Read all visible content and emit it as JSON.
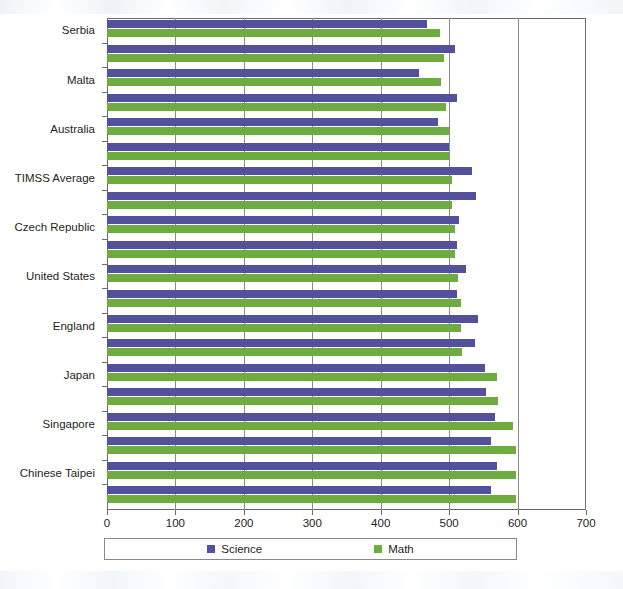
{
  "chart_data": {
    "type": "bar",
    "orientation": "horizontal",
    "title": "",
    "subtitle": "",
    "xlabel": "",
    "ylabel": "",
    "xlim": [
      0,
      700
    ],
    "xticks": [
      0,
      100,
      200,
      300,
      400,
      500,
      600,
      700
    ],
    "xtick_labels": [
      "0",
      "100",
      "200",
      "300",
      "400",
      "500",
      "600",
      "700"
    ],
    "grid": "vertical",
    "legend_position": "bottom",
    "series": [
      {
        "name": "Science",
        "color": "#53519b",
        "values": [
          468,
          508,
          456,
          511,
          484,
          500,
          534,
          539,
          515,
          512,
          524,
          512,
          542,
          538,
          552,
          554,
          567,
          561,
          570,
          561
        ]
      },
      {
        "name": "Math",
        "color": "#6fac3f",
        "values": [
          486,
          492,
          488,
          496,
          500,
          500,
          504,
          504,
          508,
          508,
          513,
          517,
          518,
          519,
          570,
          572,
          593,
          597,
          598,
          598
        ]
      }
    ],
    "categories": [
      "Serbia",
      "",
      "Malta",
      "",
      "Australia",
      "",
      "TIMSS Average",
      "",
      "Czech Republic",
      "",
      "United States",
      "",
      "England",
      "",
      "Japan",
      "",
      "Singapore",
      "",
      "Chinese Taipei",
      ""
    ],
    "visible_category_labels": [
      "Serbia",
      "Malta",
      "Australia",
      "TIMSS Average",
      "Czech Republic",
      "United States",
      "England",
      "Japan",
      "Singapore",
      "Chinese Taipei"
    ],
    "category_label_row_indices": [
      0,
      2,
      4,
      6,
      8,
      10,
      12,
      14,
      16,
      18
    ]
  },
  "legend": {
    "items": [
      {
        "label": "Science",
        "color": "#53519b",
        "swatch": "square-swatch"
      },
      {
        "label": "Math",
        "color": "#6fac3f",
        "swatch": "square-swatch"
      }
    ]
  },
  "colors": {
    "science": "#53519b",
    "math": "#6fac3f",
    "axis": "#6b6b6b",
    "grid": "#8a8a8a",
    "text": "#231f20",
    "background": "#ffffff"
  }
}
